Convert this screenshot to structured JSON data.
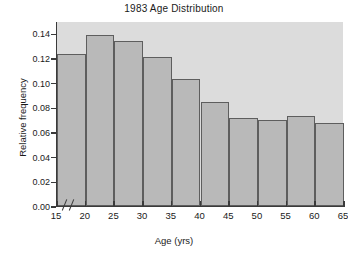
{
  "chart_data": {
    "type": "bar",
    "title": "1983 Age Distribution",
    "xlabel": "Age (yrs)",
    "ylabel": "Relative frequency",
    "grid": false,
    "legend": null,
    "axis_break_x": true,
    "bin_width": 5,
    "bin_edges": [
      15,
      20,
      25,
      30,
      35,
      40,
      45,
      50,
      55,
      60,
      65
    ],
    "categories": [
      "15-20",
      "20-25",
      "25-30",
      "30-35",
      "35-40",
      "40-45",
      "45-50",
      "50-55",
      "55-60",
      "60-65"
    ],
    "values": [
      0.123,
      0.139,
      0.134,
      0.121,
      0.103,
      0.084,
      0.071,
      0.07,
      0.073,
      0.067
    ],
    "xlim": [
      15,
      65
    ],
    "ylim": [
      0.0,
      0.15
    ],
    "x_ticks": [
      "15",
      "20",
      "25",
      "30",
      "35",
      "40",
      "45",
      "50",
      "55",
      "60",
      "65"
    ],
    "x_tick_values": [
      15,
      20,
      25,
      30,
      35,
      40,
      45,
      50,
      55,
      60,
      65
    ],
    "y_ticks": [
      "0.00",
      "0.02",
      "0.04",
      "0.06",
      "0.08",
      "0.10",
      "0.12",
      "0.14"
    ],
    "y_tick_values": [
      0.0,
      0.02,
      0.04,
      0.06,
      0.08,
      0.1,
      0.12,
      0.14
    ]
  },
  "style": {
    "plot_background": "#dcdcdc",
    "page_background": "#ffffff",
    "bar_fill": "#b9b9b9",
    "bar_edge": "#5e5e5e",
    "axis_color": "#3a3a3a",
    "text_color": "#1a1a1a"
  }
}
